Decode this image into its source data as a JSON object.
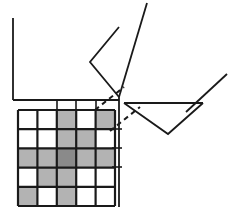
{
  "figure": {
    "title": "Geometric diagram with shaded 5x5 grid, coordinate axes, dashed projection lines and angular polyline shapes",
    "width": 232,
    "height": 210,
    "background_color": "#ffffff",
    "stroke_color": "#1a1a1a"
  },
  "palette": {
    "line": "#1a1a1a",
    "grid_line": "#1a1a1a",
    "cell_empty": "#ffffff",
    "cell_shaded": "#b3b3b3",
    "cell_dark": "#8a8a8a",
    "dashed": "#1a1a1a"
  },
  "grid": {
    "name": "shaded-cell-grid",
    "rows": 5,
    "cols": 5,
    "x": 18,
    "y": 110,
    "cell_width": 19.4,
    "cell_height": 19.2,
    "line_width": 2.2,
    "cells": [
      [
        "empty",
        "empty",
        "shaded",
        "empty",
        "shaded"
      ],
      [
        "empty",
        "empty",
        "shaded",
        "shaded",
        "empty"
      ],
      [
        "shaded",
        "shaded",
        "dark",
        "shaded",
        "shaded"
      ],
      [
        "empty",
        "shaded",
        "shaded",
        "empty",
        "empty"
      ],
      [
        "shaded",
        "empty",
        "shaded",
        "empty",
        "empty"
      ]
    ]
  },
  "axes": {
    "name": "coordinate-axes",
    "vertical_left": {
      "x": 13,
      "y_top": 18,
      "y_bottom": 100
    },
    "horizontal_bottom": {
      "y": 100,
      "x_left": 13,
      "x_right": 119
    },
    "vertical_right": {
      "x": 119,
      "y_top": 97,
      "y_bottom": 207
    },
    "line_width": 1.8
  },
  "ticks": {
    "name": "axis-tick-marks",
    "top_ticks": [
      {
        "x": 57,
        "y_top": 100,
        "y_bottom": 110
      },
      {
        "x": 76,
        "y_top": 100,
        "y_bottom": 110
      },
      {
        "x": 96,
        "y_top": 100,
        "y_bottom": 110
      }
    ],
    "right_ticks": [
      {
        "y": 129,
        "x_left": 112,
        "x_right": 122
      },
      {
        "y": 148,
        "x_left": 112,
        "x_right": 122
      },
      {
        "y": 167,
        "x_left": 112,
        "x_right": 122
      }
    ],
    "line_width": 1.6
  },
  "dashed_lines": {
    "name": "projection-dashed-lines",
    "dash_pattern": "5,4",
    "line_width": 2.0,
    "segments": [
      {
        "x1": 95,
        "y1": 110,
        "x2": 124,
        "y2": 87
      },
      {
        "x1": 110,
        "y1": 131,
        "x2": 140,
        "y2": 107
      }
    ]
  },
  "shapes": {
    "upper_chevron": {
      "name": "upper-triangle-polyline",
      "points": "119,27 90,62 119,97",
      "line_width": 1.8
    },
    "upper_ray": {
      "name": "upper-right-diagonal-ray",
      "x1": 119,
      "y1": 97,
      "x2": 147,
      "y2": 3,
      "line_width": 1.8
    },
    "lower_chevron": {
      "name": "lower-triangle-polyline",
      "points": "124,103 168,134 203,103",
      "line_width": 1.8
    },
    "lower_horizontal": {
      "name": "lower-triangle-top-edge",
      "x1": 124,
      "y1": 103,
      "x2": 203,
      "y2": 103,
      "line_width": 1.8
    },
    "lower_ray": {
      "name": "lower-right-diagonal-ray",
      "x1": 186,
      "y1": 112,
      "x2": 227,
      "y2": 74,
      "line_width": 1.8
    }
  }
}
